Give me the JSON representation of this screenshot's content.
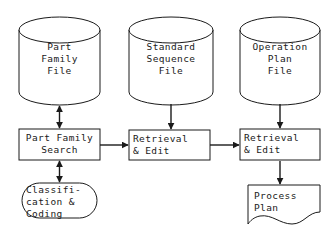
{
  "diagram": {
    "stroke_color": "#1a1a1a",
    "fill_color": "#ffffff",
    "background": "#ffffff",
    "nodes": [
      {
        "id": "part-family-file",
        "shape": "cylinder",
        "label": "Part\nFamily\nFile",
        "x": 19,
        "y": 17,
        "w": 81,
        "h": 88
      },
      {
        "id": "standard-sequence-file",
        "shape": "cylinder",
        "label": "Standard\nSequence\nFile",
        "x": 129,
        "y": 17,
        "w": 84,
        "h": 88
      },
      {
        "id": "operation-plan-file",
        "shape": "cylinder",
        "label": "Operation\nPlan\nFile",
        "x": 240,
        "y": 17,
        "w": 80,
        "h": 88
      },
      {
        "id": "part-family-search",
        "shape": "rectangle",
        "label": "Part Family\nSearch",
        "x": 19,
        "y": 129,
        "w": 81,
        "h": 31
      },
      {
        "id": "retrieval-edit-sequence",
        "shape": "rectangle",
        "label": "Retrieval\n& Edit",
        "x": 129,
        "y": 130,
        "w": 81,
        "h": 30
      },
      {
        "id": "retrieval-edit-operation",
        "shape": "rectangle",
        "label": "Retrieval\n& Edit",
        "x": 240,
        "y": 129,
        "w": 80,
        "h": 31
      },
      {
        "id": "classification-coding",
        "shape": "stadium",
        "label": "Classifi-\ncation &\nCoding",
        "x": 22,
        "y": 183,
        "w": 75,
        "h": 35
      },
      {
        "id": "process-plan",
        "shape": "document",
        "label": "Process\nPlan",
        "x": 248,
        "y": 185,
        "w": 72,
        "h": 40
      }
    ],
    "connectors": [
      {
        "id": "conn-part-family-file-search",
        "from": "part-family-file",
        "to": "part-family-search",
        "direction": "bidirectional",
        "orientation": "vertical"
      },
      {
        "id": "conn-sequence-file-retrieval",
        "from": "standard-sequence-file",
        "to": "retrieval-edit-sequence",
        "direction": "down",
        "orientation": "vertical"
      },
      {
        "id": "conn-operation-file-retrieval",
        "from": "operation-plan-file",
        "to": "retrieval-edit-operation",
        "direction": "down",
        "orientation": "vertical"
      },
      {
        "id": "conn-search-retrieval-sequence",
        "from": "part-family-search",
        "to": "retrieval-edit-sequence",
        "direction": "right",
        "orientation": "horizontal"
      },
      {
        "id": "conn-retrieval-sequence-operation",
        "from": "retrieval-edit-sequence",
        "to": "retrieval-edit-operation",
        "direction": "right",
        "orientation": "horizontal"
      },
      {
        "id": "conn-search-classification",
        "from": "part-family-search",
        "to": "classification-coding",
        "direction": "bidirectional",
        "orientation": "vertical"
      },
      {
        "id": "conn-retrieval-process-plan",
        "from": "retrieval-edit-operation",
        "to": "process-plan",
        "direction": "down",
        "orientation": "vertical"
      }
    ]
  }
}
